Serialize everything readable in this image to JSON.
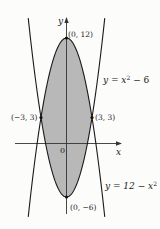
{
  "chart_data": {
    "type": "line",
    "title": "",
    "xlabel": "x",
    "ylabel": "y",
    "xlim": [
      -4.5,
      6.5
    ],
    "ylim": [
      -8,
      14
    ],
    "grid": false,
    "shaded_region": "area between y = 12 − x² and y = x² − 6 for −3 ≤ x ≤ 3",
    "series": [
      {
        "name": "y = x^2 - 6",
        "label": "y = x² − 6",
        "formula": "x^2 - 6",
        "vertex": [
          0,
          -6
        ]
      },
      {
        "name": "y = 12 - x^2",
        "label": "y = 12 − x²",
        "formula": "12 - x^2",
        "vertex": [
          0,
          12
        ]
      }
    ],
    "annotations": [
      {
        "text": "(0, 12)",
        "point": [
          0,
          12
        ]
      },
      {
        "text": "(−3, 3)",
        "point": [
          -3,
          3
        ]
      },
      {
        "text": "(3, 3)",
        "point": [
          3,
          3
        ]
      },
      {
        "text": "(0, −6)",
        "point": [
          0,
          -6
        ]
      },
      {
        "text": "0",
        "point": [
          0,
          0
        ]
      }
    ]
  },
  "labels": {
    "y_axis": "y",
    "x_axis": "x",
    "origin": "0",
    "top_vertex": "(0, 12)",
    "bottom_vertex": "(0, −6)",
    "left_intersection": "(−3, 3)",
    "right_intersection": "(3, 3)",
    "curve_up_prefix": "y = x",
    "curve_up_exp": "2",
    "curve_up_suffix": " − 6",
    "curve_down_prefix": "y = 12 − x",
    "curve_down_exp": "2"
  },
  "colors": {
    "shade": "#b8b8b8",
    "line": "#1a1a1a",
    "background": "#fcfcfb"
  }
}
